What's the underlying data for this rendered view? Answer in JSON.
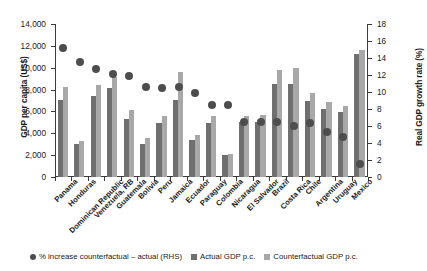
{
  "chart_data": {
    "type": "bar",
    "title": "",
    "xlabel": "",
    "ylabel": "GDP per capita (US$)",
    "y2label": "Real GDP growth rate (%)",
    "ylim": [
      0,
      14000
    ],
    "y2lim": [
      0,
      18
    ],
    "yticks": [
      "0",
      "2,000",
      "4,000",
      "6,000",
      "8,000",
      "10,000",
      "12,000",
      "14,000"
    ],
    "ytick_values": [
      0,
      2000,
      4000,
      6000,
      8000,
      10000,
      12000,
      14000
    ],
    "y2ticks": [
      "0",
      "2",
      "4",
      "6",
      "8",
      "10",
      "12",
      "14",
      "16",
      "18"
    ],
    "y2tick_values": [
      0,
      2,
      4,
      6,
      8,
      10,
      12,
      14,
      16,
      18
    ],
    "grid": false,
    "legend_position": "bottom",
    "categories": [
      "Panama",
      "Honduras",
      "Dominican Republic",
      "Venezuela, RB",
      "Guatemala",
      "Bolivia",
      "Peru",
      "Jamaica",
      "Ecuador",
      "Paraguay",
      "Colombia",
      "Nicaragua",
      "El Salvador",
      "Brazil",
      "Costa Rica",
      "Chile",
      "Argentina",
      "Uruguay",
      "Mexico"
    ],
    "series": [
      {
        "name": "Actual GDP p.c.",
        "type": "bar",
        "axis": "left",
        "color": "#6f6f6f",
        "values": [
          7050,
          3000,
          7400,
          8100,
          5350,
          3050,
          4950,
          7050,
          3350,
          4950,
          2000,
          5000,
          5050,
          8500,
          8550,
          6950,
          6200,
          5950,
          11250
        ]
      },
      {
        "name": "Counterfactual GDP p.c.",
        "type": "bar",
        "axis": "left",
        "color": "#a8a8a8",
        "values": [
          8250,
          3300,
          8400,
          9150,
          6100,
          3550,
          5550,
          9650,
          3850,
          5550,
          2150,
          5600,
          5650,
          9800,
          9950,
          7650,
          6850,
          6500,
          11650
        ]
      },
      {
        "name": "% increase counterfactual – actual (RHS)",
        "type": "scatter",
        "axis": "right",
        "color": "#4d4d4d",
        "values": [
          15.6,
          14.0,
          13.2,
          12.6,
          12.4,
          11.1,
          11.0,
          11.1,
          10.3,
          9.0,
          8.9,
          7.0,
          7.0,
          6.9,
          6.5,
          6.8,
          5.8,
          5.2,
          2.0
        ]
      }
    ],
    "legend": [
      {
        "label": "% increase counterfactual – actual (RHS)",
        "marker": "dot",
        "color": "#4d4d4d"
      },
      {
        "label": "Actual GDP p.c.",
        "marker": "square",
        "color": "#6f6f6f"
      },
      {
        "label": "Counterfactual GDP p.c.",
        "marker": "square",
        "color": "#a8a8a8"
      }
    ]
  }
}
